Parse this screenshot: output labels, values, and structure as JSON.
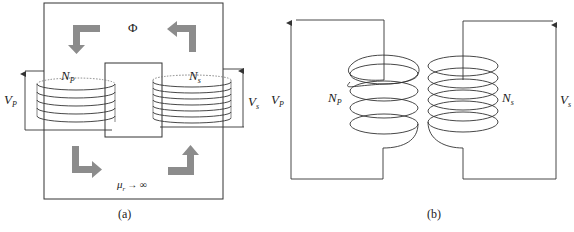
{
  "figure": {
    "panels": [
      {
        "id": "a",
        "caption": "(a)",
        "title": "Transformer on magnetic core",
        "flux_label": "Φ",
        "permeability_label": "μ",
        "permeability_sub": "r",
        "permeability_limit": "→ ∞",
        "primary": {
          "turns_label": "N",
          "turns_sub": "P",
          "voltage_label": "V",
          "voltage_sub": "P",
          "loops": 5
        },
        "secondary": {
          "turns_label": "N",
          "turns_sub": "s",
          "voltage_label": "V",
          "voltage_sub": "s",
          "loops": 7
        },
        "flux_arrow_color": "#8c8c8c"
      },
      {
        "id": "b",
        "caption": "(b)",
        "title": "Coupled coils without core",
        "primary": {
          "turns_label": "N",
          "turns_sub": "P",
          "voltage_label": "V",
          "voltage_sub": "P",
          "loops": 4
        },
        "secondary": {
          "turns_label": "N",
          "turns_sub": "s",
          "voltage_label": "V",
          "voltage_sub": "s",
          "loops": 6
        }
      }
    ],
    "line_color": "#333333"
  }
}
